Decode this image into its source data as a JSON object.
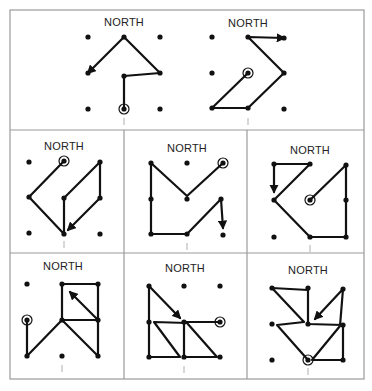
{
  "figure": {
    "panel_label": "NORTH",
    "colors": {
      "ink": "#111111",
      "frame": "#9a9a9a",
      "background": "#ffffff"
    },
    "frame": {
      "outer": [
        10,
        10,
        364,
        379
      ],
      "row_dividers": [
        130,
        253
      ],
      "col_dividers": [
        124,
        247
      ]
    },
    "panels": [
      {
        "id": "row1-col1",
        "label_pos": [
          124,
          26
        ],
        "dots": [
          [
            88,
            37
          ],
          [
            124,
            37
          ],
          [
            160,
            37
          ],
          [
            88,
            73
          ],
          [
            124,
            76
          ],
          [
            160,
            73
          ],
          [
            88,
            109
          ],
          [
            124,
            109
          ],
          [
            160,
            109
          ]
        ],
        "start": [
          124,
          109
        ],
        "path": [
          [
            124,
            109
          ],
          [
            124,
            76
          ],
          [
            160,
            73
          ],
          [
            124,
            37
          ],
          [
            88,
            73
          ]
        ],
        "arrow_end": true,
        "tick": [
          124,
          122
        ]
      },
      {
        "id": "row1-col2",
        "label_pos": [
          248,
          27
        ],
        "dots": [
          [
            212,
            37
          ],
          [
            248,
            37
          ],
          [
            284,
            38
          ],
          [
            212,
            73
          ],
          [
            248,
            73
          ],
          [
            284,
            73
          ],
          [
            212,
            108
          ],
          [
            248,
            108
          ],
          [
            284,
            109
          ]
        ],
        "start": [
          248,
          73
        ],
        "path": [
          [
            248,
            73
          ],
          [
            212,
            108
          ],
          [
            248,
            108
          ],
          [
            284,
            73
          ],
          [
            248,
            37
          ],
          [
            284,
            38
          ]
        ],
        "arrow_end": true,
        "tick": [
          248,
          122
        ]
      },
      {
        "id": "row2-col1",
        "label_pos": [
          64,
          150
        ],
        "dots": [
          [
            29,
            162
          ],
          [
            64,
            161
          ],
          [
            100,
            162
          ],
          [
            29,
            197
          ],
          [
            64,
            198
          ],
          [
            100,
            198
          ],
          [
            29,
            233
          ],
          [
            64,
            234
          ],
          [
            100,
            234
          ]
        ],
        "start": [
          64,
          161
        ],
        "path": [
          [
            64,
            161
          ],
          [
            29,
            197
          ],
          [
            64,
            234
          ],
          [
            64,
            198
          ],
          [
            100,
            162
          ],
          [
            100,
            198
          ],
          [
            68,
            230
          ]
        ],
        "arrow_end": true,
        "tick": [
          64,
          245
        ]
      },
      {
        "id": "row2-col2",
        "label_pos": [
          187,
          152
        ],
        "dots": [
          [
            151,
            163
          ],
          [
            187,
            163
          ],
          [
            223,
            163
          ],
          [
            151,
            199
          ],
          [
            187,
            199
          ],
          [
            221,
            199
          ],
          [
            151,
            234
          ],
          [
            187,
            234
          ],
          [
            223,
            235
          ]
        ],
        "start": [
          223,
          163
        ],
        "path": [
          [
            223,
            163
          ],
          [
            187,
            196
          ],
          [
            151,
            163
          ],
          [
            151,
            234
          ],
          [
            187,
            234
          ],
          [
            221,
            199
          ],
          [
            223,
            228
          ]
        ],
        "arrow_end": true,
        "tick": [
          187,
          247
        ]
      },
      {
        "id": "row2-col3",
        "label_pos": [
          310,
          154
        ],
        "dots": [
          [
            274,
            164
          ],
          [
            310,
            164
          ],
          [
            346,
            165
          ],
          [
            274,
            200
          ],
          [
            310,
            200
          ],
          [
            346,
            200
          ],
          [
            274,
            237
          ],
          [
            310,
            237
          ],
          [
            346,
            237
          ]
        ],
        "start": [
          310,
          200
        ],
        "path": [
          [
            310,
            200
          ],
          [
            346,
            165
          ],
          [
            346,
            200
          ],
          [
            346,
            237
          ],
          [
            310,
            237
          ],
          [
            274,
            200
          ],
          [
            310,
            164
          ],
          [
            274,
            164
          ],
          [
            274,
            192
          ]
        ],
        "arrow_end": true,
        "tick": [
          310,
          249
        ]
      },
      {
        "id": "row3-col1",
        "label_pos": [
          63,
          270
        ],
        "dots": [
          [
            27,
            284
          ],
          [
            62,
            284
          ],
          [
            98,
            284
          ],
          [
            27,
            320
          ],
          [
            62,
            320
          ],
          [
            98,
            320
          ],
          [
            27,
            356
          ],
          [
            62,
            356
          ],
          [
            98,
            356
          ]
        ],
        "start": [
          27,
          320
        ],
        "path": [
          [
            27,
            320
          ],
          [
            27,
            356
          ],
          [
            62,
            320
          ],
          [
            98,
            356
          ],
          [
            98,
            320
          ],
          [
            98,
            284
          ],
          [
            62,
            284
          ],
          [
            62,
            320
          ],
          [
            98,
            320
          ],
          [
            70,
            292
          ]
        ],
        "arrow_end": true,
        "tick": [
          62,
          369
        ]
      },
      {
        "id": "row3-col2",
        "label_pos": [
          185,
          272
        ],
        "dots": [
          [
            149,
            286
          ],
          [
            184,
            286
          ],
          [
            220,
            286
          ],
          [
            149,
            322
          ],
          [
            184,
            322
          ],
          [
            220,
            322
          ],
          [
            149,
            357
          ],
          [
            184,
            357
          ],
          [
            220,
            357
          ]
        ],
        "start": [
          220,
          322
        ],
        "path": [
          [
            220,
            322
          ],
          [
            184,
            322
          ],
          [
            184,
            357
          ],
          [
            217,
            357
          ],
          [
            187,
            323
          ],
          [
            154,
            322
          ],
          [
            180,
            357
          ],
          [
            149,
            357
          ],
          [
            149,
            322
          ],
          [
            149,
            286
          ],
          [
            180,
            318
          ]
        ],
        "arrow_end": true,
        "tick": [
          184,
          370
        ]
      },
      {
        "id": "row3-col3",
        "label_pos": [
          308,
          274
        ],
        "dots": [
          [
            272,
            288
          ],
          [
            308,
            288
          ],
          [
            343,
            289
          ],
          [
            272,
            324
          ],
          [
            308,
            324
          ],
          [
            343,
            325
          ],
          [
            272,
            360
          ],
          [
            308,
            360
          ],
          [
            343,
            360
          ]
        ],
        "start": [
          308,
          360
        ],
        "path": [
          [
            308,
            360
          ],
          [
            277,
            325
          ],
          [
            304,
            322
          ],
          [
            272,
            288
          ],
          [
            308,
            290
          ],
          [
            308,
            324
          ],
          [
            343,
            325
          ],
          [
            343,
            360
          ],
          [
            312,
            360
          ],
          [
            340,
            326
          ],
          [
            343,
            289
          ],
          [
            315,
            319
          ]
        ],
        "arrow_end": true,
        "tick": [
          308,
          372
        ]
      }
    ]
  }
}
